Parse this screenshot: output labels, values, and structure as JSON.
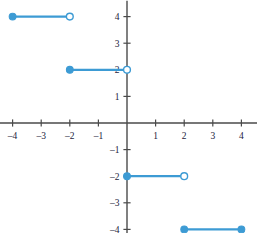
{
  "chart_data": {
    "type": "line",
    "title": "",
    "subtitle": "",
    "xlabel": "x",
    "ylabel": "y",
    "xlim": [
      -4.6,
      4.6
    ],
    "ylim": [
      -4.6,
      4.6
    ],
    "grid": false,
    "legend": null,
    "x_ticks": [
      -4,
      -3,
      -2,
      -1,
      1,
      2,
      3,
      4
    ],
    "y_ticks": [
      -4,
      -3,
      -2,
      -1,
      1,
      2,
      3,
      4
    ],
    "x_tick_labels": [
      "–4",
      "–3",
      "–2",
      "–1",
      "1",
      "2",
      "3",
      "4"
    ],
    "y_tick_labels": [
      "–4",
      "–3",
      "–2",
      "–1",
      "1",
      "2",
      "3",
      "4"
    ],
    "series": [
      {
        "name": "step-segment-1",
        "y": 4,
        "x_start": -4,
        "x_end": -2,
        "start_point": "closed",
        "end_point": "open"
      },
      {
        "name": "step-segment-2",
        "y": 2,
        "x_start": -2,
        "x_end": 0,
        "start_point": "closed",
        "end_point": "open"
      },
      {
        "name": "step-segment-3",
        "y": -2,
        "x_start": 0,
        "x_end": 2,
        "start_point": "closed",
        "end_point": "open"
      },
      {
        "name": "step-segment-4",
        "y": -4,
        "x_start": 2,
        "x_end": 4,
        "start_point": "closed",
        "end_point": "closed"
      }
    ],
    "colors": {
      "curve": "#3d9bd4",
      "marker_fill": "#3d9bd4",
      "marker_open_fill": "#ffffff",
      "axis": "#4a4a4a",
      "tick_label": "#23233c",
      "background": "#ffffff"
    }
  }
}
